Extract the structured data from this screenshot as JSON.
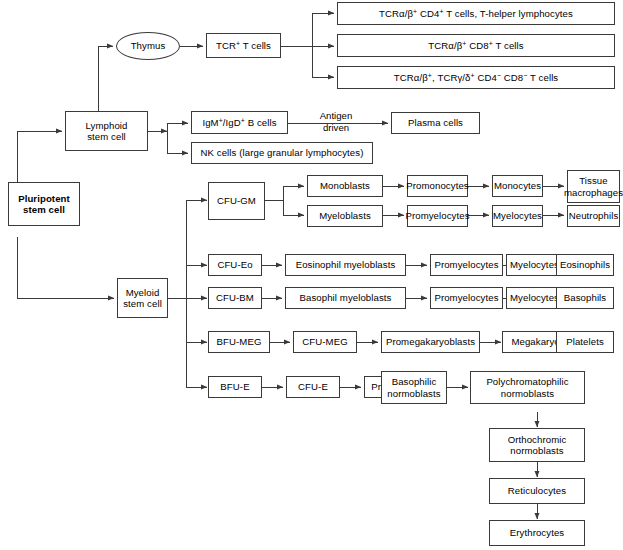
{
  "diagram": {
    "type": "flowchart",
    "stroke_color": "#3a3a3a",
    "background_color": "#ffffff",
    "text_color": "#000000"
  },
  "nodes": {
    "pluripotent": "Pluripotent\nstem cell",
    "lymphoid": "Lymphoid\nstem cell",
    "myeloid": "Myeloid\nstem cell",
    "thymus": "Thymus",
    "tcr_t_cells": "TCR+ T cells",
    "t_helper": "TCRα/β+ CD4+ T cells, T-helper lymphocytes",
    "t_cd8": "TCRα/β+ CD8+ T cells",
    "t_dn": "TCRα/β+, TCRγ/δ+ CD4− CD8− T cells",
    "b_cells": "IgM+/IgD+ B cells",
    "nk_cells": "NK cells (large granular lymphocytes)",
    "plasma_cells": "Plasma cells",
    "antigen_driven": "Antigen\ndriven",
    "cfu_gm": "CFU-GM",
    "monoblasts": "Monoblasts",
    "promonocytes": "Promonocytes",
    "monocytes": "Monocytes",
    "tissue_macrophages": "Tissue\nmacrophages",
    "myeloblasts": "Myeloblasts",
    "promyelocytes_gm": "Promyelocytes",
    "myelocytes_gm": "Myelocytes",
    "neutrophils": "Neutrophils",
    "cfu_eo": "CFU-Eo",
    "eosinophil_myeloblasts": "Eosinophil myeloblasts",
    "promyelocytes_eo": "Promyelocytes",
    "myelocytes_eo": "Myelocytes",
    "eosinophils": "Eosinophils",
    "cfu_bm": "CFU-BM",
    "basophil_myeloblasts": "Basophil myeloblasts",
    "promyelocytes_bm": "Promyelocytes",
    "myelocytes_bm": "Myelocytes",
    "basophils": "Basophils",
    "bfu_meg": "BFU-MEG",
    "cfu_meg": "CFU-MEG",
    "promegakaryoblasts": "Promegakaryoblasts",
    "megakaryocytes": "Megakaryocytes",
    "platelets": "Platelets",
    "bfu_e": "BFU-E",
    "cfu_e": "CFU-E",
    "pronormoblasts": "Pronormoblasts",
    "basophilic_normoblasts": "Basophilic\nnormoblasts",
    "polychromatophilic_normoblasts": "Polychromatophilic\nnormoblasts",
    "orthochromic_normoblasts": "Orthochromic\nnormoblasts",
    "reticulocytes": "Reticulocytes",
    "erythrocytes": "Erythrocytes"
  }
}
